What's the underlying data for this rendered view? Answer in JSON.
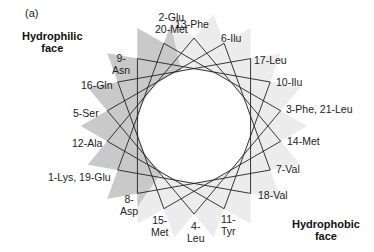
{
  "panel_label": "(a)",
  "faces": {
    "hydrophilic": [
      "Hydrophilic",
      "face"
    ],
    "hydrophobic": [
      "Hydrophobic",
      "face"
    ]
  },
  "wheel": {
    "center": [
      194,
      126
    ],
    "outer_radius": 88,
    "inner_radius": 56,
    "star_step": 5,
    "colors": {
      "hydrophilic_fill": "#c9c9c9",
      "hydrophobic_fill": "#ececec",
      "line": "#222222"
    },
    "positions": [
      {
        "angle": -90,
        "residues": "13-Phe"
      },
      {
        "angle": -70,
        "residues": "6-Ilu"
      },
      {
        "angle": -50,
        "residues": "17-Leu"
      },
      {
        "angle": -30,
        "residues": "10-Ilu"
      },
      {
        "angle": -10,
        "residues": "3-Phe, 21-Leu"
      },
      {
        "angle": 10,
        "residues": "14-Met"
      },
      {
        "angle": 30,
        "residues": "7-Val"
      },
      {
        "angle": 50,
        "residues": "18-Val"
      },
      {
        "angle": 70,
        "residues": "11-Tyr"
      },
      {
        "angle": 90,
        "residues": "4-Leu"
      },
      {
        "angle": 110,
        "residues": "15-Met"
      },
      {
        "angle": 130,
        "residues": "8-Asp"
      },
      {
        "angle": 150,
        "residues": "1-Lys, 19-Glu"
      },
      {
        "angle": 170,
        "residues": "12-Ala"
      },
      {
        "angle": 190,
        "residues": "5-Ser"
      },
      {
        "angle": 210,
        "residues": "16-Gln"
      },
      {
        "angle": 230,
        "residues": "9-Asn"
      },
      {
        "angle": 250,
        "residues": "2-Glu 20-Met"
      }
    ]
  },
  "labels": [
    {
      "text": [
        "2-Glu",
        "20-Met"
      ],
      "x": 155,
      "y": 11,
      "align": "c"
    },
    {
      "text": [
        "13-Phe"
      ],
      "x": 175,
      "y": 18,
      "align": "l"
    },
    {
      "text": [
        "6-Ilu"
      ],
      "x": 221,
      "y": 32,
      "align": "l"
    },
    {
      "text": [
        "17-Leu"
      ],
      "x": 254,
      "y": 54,
      "align": "l"
    },
    {
      "text": [
        "10-Ilu"
      ],
      "x": 276,
      "y": 76,
      "align": "l"
    },
    {
      "text": [
        "3-Phe, 21-Leu"
      ],
      "x": 286,
      "y": 103,
      "align": "l"
    },
    {
      "text": [
        "14-Met"
      ],
      "x": 287,
      "y": 135,
      "align": "l"
    },
    {
      "text": [
        "7-Val"
      ],
      "x": 276,
      "y": 163,
      "align": "l"
    },
    {
      "text": [
        "18-Val"
      ],
      "x": 258,
      "y": 189,
      "align": "l"
    },
    {
      "text": [
        "11-",
        "Tyr"
      ],
      "x": 221,
      "y": 213,
      "align": "c"
    },
    {
      "text": [
        "4-",
        "Leu"
      ],
      "x": 187,
      "y": 220,
      "align": "c"
    },
    {
      "text": [
        "15-",
        "Met"
      ],
      "x": 151,
      "y": 214,
      "align": "c"
    },
    {
      "text": [
        "8-",
        "Asp"
      ],
      "x": 120,
      "y": 193,
      "align": "c"
    },
    {
      "text": [
        "1-Lys, 19-Glu"
      ],
      "x": 48,
      "y": 171,
      "align": "l"
    },
    {
      "text": [
        "12-Ala"
      ],
      "x": 72,
      "y": 137,
      "align": "l"
    },
    {
      "text": [
        "5-Ser"
      ],
      "x": 73,
      "y": 107,
      "align": "l"
    },
    {
      "text": [
        "16-Gln"
      ],
      "x": 81,
      "y": 79,
      "align": "l"
    },
    {
      "text": [
        "9-",
        "Asn"
      ],
      "x": 112,
      "y": 52,
      "align": "c"
    }
  ]
}
